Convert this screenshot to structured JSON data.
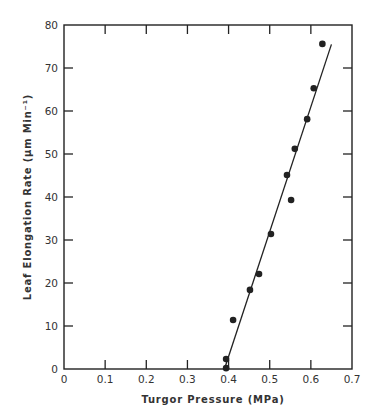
{
  "chart_data": {
    "type": "scatter",
    "title": "",
    "xlabel": "Turgor Pressure (MPa)",
    "ylabel": "Leaf Elongation Rate (μm Min⁻¹)",
    "xlim": [
      0,
      0.7
    ],
    "ylim": [
      0,
      80
    ],
    "xticks": [
      0,
      0.1,
      0.2,
      0.3,
      0.4,
      0.5,
      0.6,
      0.7
    ],
    "xtick_labels": [
      "0",
      "0.1",
      "0.2",
      "0.3",
      "0.4",
      "0.5",
      "0.6",
      "0.7"
    ],
    "yticks": [
      0,
      10,
      20,
      30,
      40,
      50,
      60,
      70,
      80
    ],
    "ytick_labels": [
      "0",
      "10",
      "20",
      "30",
      "40",
      "50",
      "60",
      "70",
      "80"
    ],
    "grid": false,
    "legend": null,
    "series": [
      {
        "name": "observations",
        "style": "filled-circle",
        "x": [
          0.394,
          0.394,
          0.411,
          0.452,
          0.474,
          0.503,
          0.542,
          0.552,
          0.561,
          0.591,
          0.607,
          0.628
        ],
        "y": [
          0.2,
          2.3,
          11.4,
          18.4,
          22.1,
          31.4,
          45.1,
          39.3,
          51.2,
          58.1,
          65.3,
          75.6
        ]
      },
      {
        "name": "fitted line",
        "style": "line",
        "x": [
          0.39,
          0.65
        ],
        "y": [
          0,
          75.5
        ]
      }
    ]
  },
  "colors": {
    "ink": "#222222",
    "background": "#ffffff"
  }
}
